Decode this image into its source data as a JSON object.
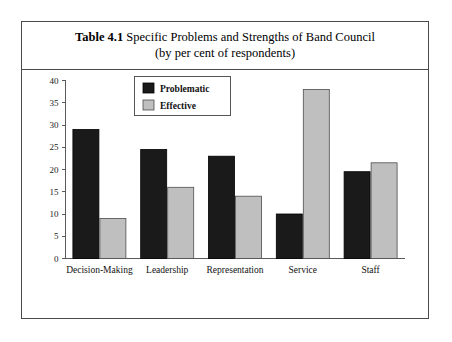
{
  "caption": {
    "label": "Table 4.1",
    "title": "Specific Problems and Strengths of Band Council",
    "subtitle": "(by per cent of respondents)"
  },
  "chart_data": {
    "type": "bar",
    "title": "Table 4.1 Specific Problems and Strengths of Band Council (by per cent of respondents)",
    "xlabel": "",
    "ylabel": "",
    "ylim": [
      0,
      40
    ],
    "ytick_step": 5,
    "yticks": [
      "0",
      "5",
      "10",
      "15",
      "20",
      "25",
      "30",
      "35",
      "40"
    ],
    "grid": false,
    "legend_position": "top-center",
    "categories": [
      "Decision-Making",
      "Leadership",
      "Representation",
      "Service",
      "Staff"
    ],
    "series": [
      {
        "name": "Problematic",
        "color": "#1a1a1a",
        "values": [
          29,
          24.5,
          23,
          10,
          19.5
        ]
      },
      {
        "name": "Effective",
        "color": "#bfbfbf",
        "values": [
          9,
          16,
          14,
          38,
          21.5
        ]
      }
    ]
  },
  "legend": {
    "entries": [
      {
        "label": "Problematic",
        "swatch": "dark-swatch"
      },
      {
        "label": "Effective",
        "swatch": "light-swatch"
      }
    ]
  }
}
